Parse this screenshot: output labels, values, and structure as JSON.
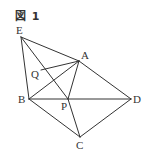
{
  "figure": {
    "title": "図 1",
    "line_color": "#333333",
    "points": {
      "E": {
        "label": "E",
        "x": 21,
        "y": 37
      },
      "A": {
        "label": "A",
        "x": 79,
        "y": 61
      },
      "Q": {
        "label": "Q",
        "x": 41,
        "y": 70
      },
      "B": {
        "label": "B",
        "x": 29,
        "y": 99
      },
      "P": {
        "label": "P",
        "x": 68,
        "y": 99
      },
      "D": {
        "label": "D",
        "x": 131,
        "y": 99
      },
      "C": {
        "label": "C",
        "x": 80,
        "y": 137
      }
    },
    "segments": [
      "EA",
      "EB",
      "EP",
      "QA",
      "AB",
      "AP",
      "AD",
      "BD",
      "BC",
      "CD",
      "PC"
    ]
  }
}
